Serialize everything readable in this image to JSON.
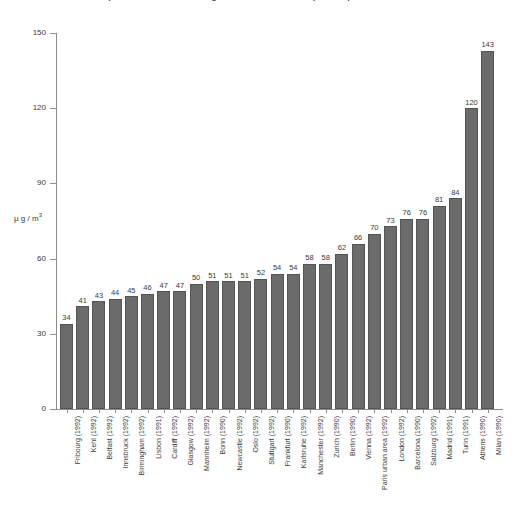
{
  "chart_data": {
    "type": "bar",
    "title": "Air pollution – annual average concentration of suspended particulate matter",
    "xlabel": "",
    "ylabel": "µg / m³",
    "ylim": [
      0,
      150
    ],
    "yticks": [
      0,
      30,
      60,
      90,
      120,
      150
    ],
    "grid": false,
    "legend": "none",
    "bar_color": "#6b6b6b",
    "categories": [
      "Fribourg (1992)",
      "Kehl (1992)",
      "Belfast (1992)",
      "Innsbruck (1992)",
      "Birmingham (1992)",
      "Lisbon (1991)",
      "Cardiff (1992)",
      "Glasgow (1992)",
      "Mannheim (1992)",
      "Bonn (1990)",
      "Newcastle (1992)",
      "Oslo (1992)",
      "Stuttgart (1992)",
      "Frankfurt (1990)",
      "Karlsruhe (1992)",
      "Manchester (1992)",
      "Zurich (1990)",
      "Berlin (1990)",
      "Vienna (1992)",
      "Paris urban area (1992)",
      "London (1992)",
      "Barcelona (1990)",
      "Salzburg (1992)",
      "Madrid (1991)",
      "Turin (1991)",
      "Athens (1990)",
      "Milan (1990)"
    ],
    "values": [
      34,
      41,
      43,
      44,
      45,
      46,
      47,
      47,
      50,
      51,
      51,
      51,
      52,
      54,
      54,
      58,
      58,
      62,
      66,
      70,
      73,
      76,
      76,
      81,
      84,
      120,
      143
    ]
  }
}
